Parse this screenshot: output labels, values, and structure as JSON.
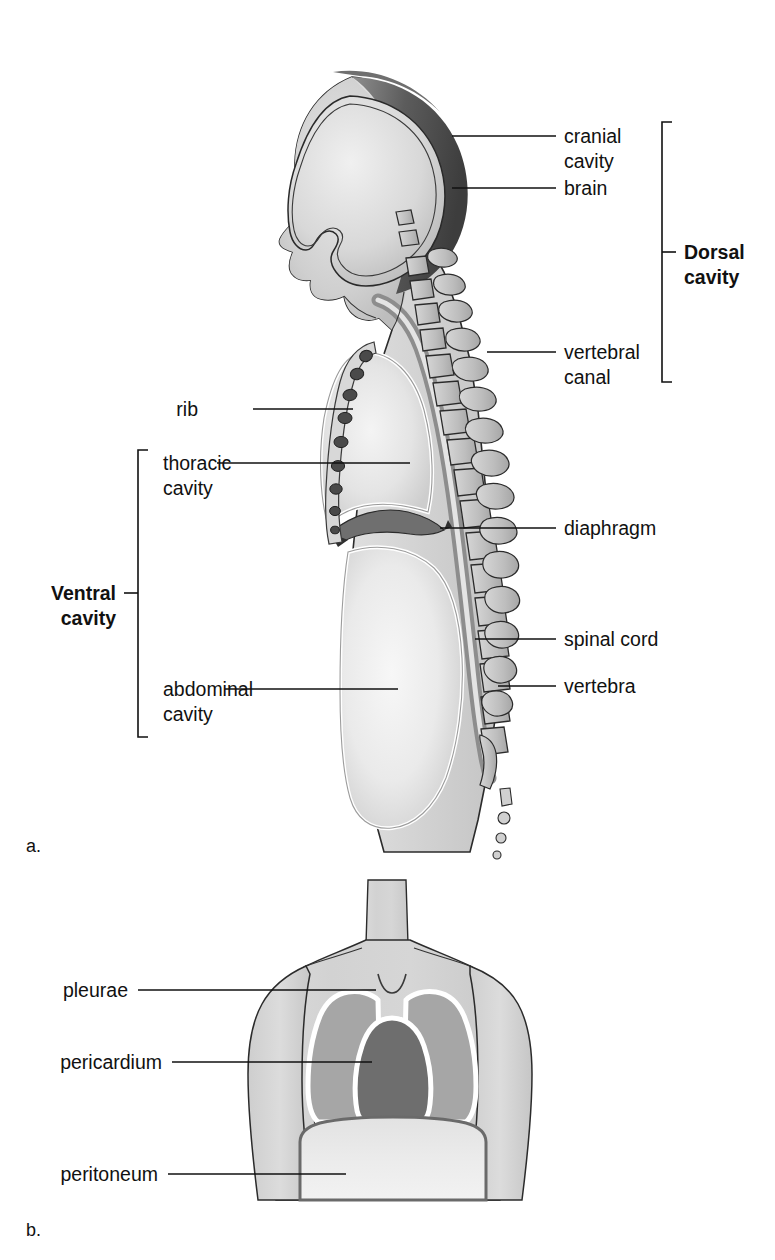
{
  "figure": {
    "panels": [
      {
        "id": "a",
        "label": "a.",
        "caption": "lateral view of body cavities"
      },
      {
        "id": "b",
        "label": "b.",
        "caption": "anterior view of membranes"
      }
    ]
  },
  "panel_a": {
    "labels": {
      "cranial_cavity_line1": "cranial",
      "cranial_cavity_line2": "cavity",
      "brain": "brain",
      "vertebral_canal_line1": "vertebral",
      "vertebral_canal_line2": "canal",
      "dorsal_cavity_line1": "Dorsal",
      "dorsal_cavity_line2": "cavity",
      "rib": "rib",
      "thoracic_cavity_line1": "thoracic",
      "thoracic_cavity_line2": "cavity",
      "ventral_cavity_line1": "Ventral",
      "ventral_cavity_line2": "cavity",
      "abdominal_cavity_line1": "abdominal",
      "abdominal_cavity_line2": "cavity",
      "diaphragm": "diaphragm",
      "spinal_cord": "spinal cord",
      "vertebra": "vertebra"
    },
    "panel_letter": "a."
  },
  "panel_b": {
    "labels": {
      "pleurae": "pleurae",
      "pericardium": "pericardium",
      "peritoneum": "peritoneum"
    },
    "panel_letter": "b."
  },
  "colors": {
    "background": "#ffffff",
    "ink": "#111111",
    "body_light": "#d4d4d4",
    "body_lighter": "#e6e6e6",
    "cavity_light": "#efefef",
    "bone_gray": "#b9b9b9",
    "skull_dark": "#4a4a4a",
    "pleura_gray": "#a6a6a6",
    "pericardium_dark": "#6e6e6e",
    "diaphragm_dark": "#7a7a7a",
    "rib_dark": "#5a5a5a"
  }
}
